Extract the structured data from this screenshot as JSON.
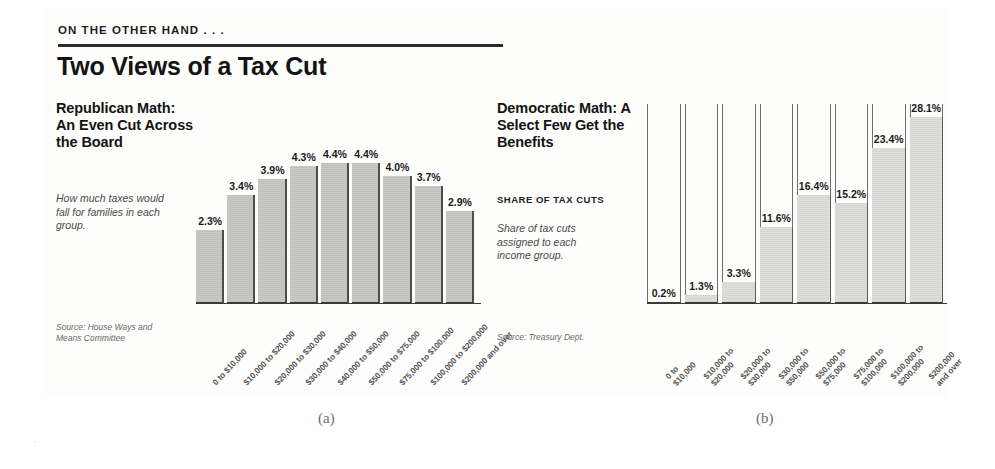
{
  "header": {
    "kicker": "ON THE OTHER HAND . . .",
    "headline": "Two Views of a Tax Cut"
  },
  "panel_a": {
    "title": "Republican Math: An Even Cut Across the Board",
    "blurb": "How much taxes would fall for families in each group.",
    "source": "Source: House Ways and Means Committee",
    "caption": "(a)"
  },
  "panel_b": {
    "title": "Democratic Math: A Select Few Get the Benefits",
    "subhead": "SHARE OF TAX CUTS",
    "blurb": "Share of tax cuts assigned to each income group.",
    "source": "Source: Treasury Dept.",
    "caption": "(b)"
  },
  "chart_data": [
    {
      "type": "bar",
      "id": "republican-math",
      "title": "Republican Math: An Even Cut Across the Board",
      "xlabel": "",
      "ylabel": "Percent tax cut",
      "ylim": [
        0,
        5.0
      ],
      "grid": false,
      "legend": "none",
      "categories": [
        "0 to $10,000",
        "$10,000 to $20,000",
        "$20,000 to $30,000",
        "$30,000 to $40,000",
        "$40,000 to $50,000",
        "$50,000 to $75,000",
        "$75,000 to $100,000",
        "$100,000 to $200,000",
        "$200,000 and over"
      ],
      "values": [
        2.3,
        3.4,
        3.9,
        4.3,
        4.4,
        4.4,
        4.0,
        3.7,
        2.9
      ],
      "value_labels": [
        "2.3%",
        "3.4%",
        "3.9%",
        "4.3%",
        "4.4%",
        "4.4%",
        "4.0%",
        "3.7%",
        "2.9%"
      ]
    },
    {
      "type": "bar",
      "id": "democratic-math",
      "title": "Democratic Math: A Select Few Get the Benefits",
      "xlabel": "",
      "ylabel": "Share of tax cuts",
      "ylim": [
        0,
        30.0
      ],
      "grid": false,
      "legend": "none",
      "categories": [
        "0 to\n$10,000",
        "$10,000 to\n$20,000",
        "$20,000 to\n$30,000",
        "$30,000 to\n$50,000",
        "$50,000 to\n$75,000",
        "$75,000 to\n$100,000",
        "$100,000 to\n$200,000",
        "$200,000\nand over"
      ],
      "values": [
        0.2,
        1.3,
        3.3,
        11.6,
        16.4,
        15.2,
        23.4,
        28.1
      ],
      "value_labels": [
        "0.2%",
        "1.3%",
        "3.3%",
        "11.6%",
        "16.4%",
        "15.2%",
        "23.4%",
        "28.1%"
      ]
    }
  ],
  "colors": {
    "bar_fill_a": "#c9c9c5",
    "bar_fill_b": "#dededa",
    "bar_edge": "#3a3a3a",
    "text": "#141414",
    "muted": "#6a6a6a"
  }
}
